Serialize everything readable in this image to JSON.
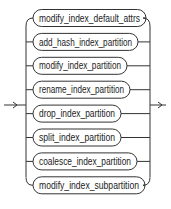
{
  "diagram": {
    "type": "railroad-syntax-diagram",
    "entry_arrow": "→",
    "exit_arrow": "→",
    "choices": [
      {
        "label": "modify_index_default_attrs",
        "width": 113
      },
      {
        "label": "add_hash_index_partition",
        "width": 105
      },
      {
        "label": "modify_index_partition",
        "width": 94
      },
      {
        "label": "rename_index_partition",
        "width": 97
      },
      {
        "label": "drop_index_partition",
        "width": 88
      },
      {
        "label": "split_index_partition",
        "width": 88
      },
      {
        "label": "coalesce_index_partition",
        "width": 104
      },
      {
        "label": "modify_index_subpartition",
        "width": 112
      }
    ]
  },
  "colors": {
    "line": "#333333",
    "text": "#222222",
    "background": "#ffffff"
  }
}
